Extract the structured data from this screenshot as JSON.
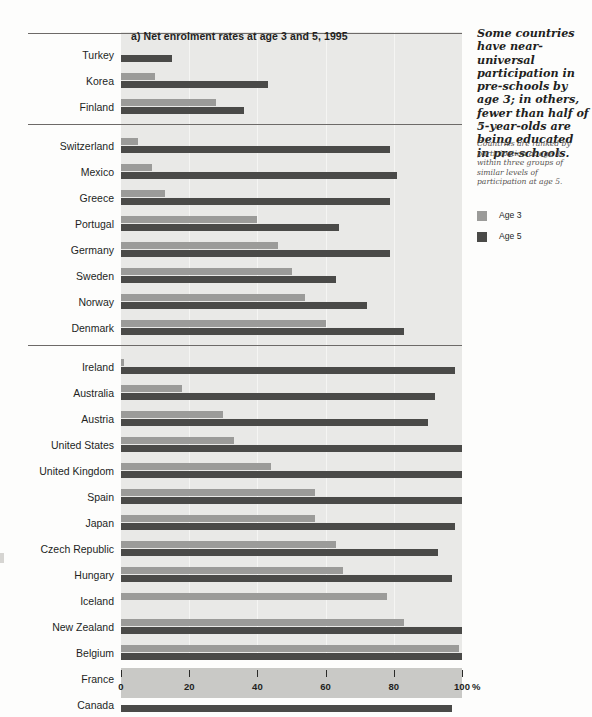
{
  "chart_data": {
    "type": "bar",
    "orientation": "horizontal",
    "title": "a) Net enrolment rates at age 3 and 5, 1995",
    "xlabel": "%",
    "ylabel": "",
    "xlim": [
      0,
      100
    ],
    "ticks": [
      0,
      20,
      40,
      60,
      80,
      100
    ],
    "grid": true,
    "legend_position": "right-sidebar",
    "series": [
      {
        "name": "Age 3",
        "color": "#9b9b99"
      },
      {
        "name": "Age 5",
        "color": "#4a4a48"
      }
    ],
    "groups": [
      {
        "id": "group-1",
        "categories": [
          "Turkey",
          "Korea",
          "Finland"
        ],
        "Age 3": [
          0,
          10,
          28
        ],
        "Age 5": [
          15,
          43,
          36
        ]
      },
      {
        "id": "group-2",
        "categories": [
          "Switzerland",
          "Mexico",
          "Greece",
          "Portugal",
          "Germany",
          "Sweden",
          "Norway",
          "Denmark"
        ],
        "Age 3": [
          5,
          9,
          13,
          40,
          46,
          50,
          54,
          60
        ],
        "Age 5": [
          79,
          81,
          79,
          64,
          79,
          63,
          72,
          83
        ]
      },
      {
        "id": "group-3",
        "categories": [
          "Ireland",
          "Australia",
          "Austria",
          "United States",
          "United Kingdom",
          "Spain",
          "Japan",
          "Czech Republic",
          "Hungary",
          "Iceland",
          "New Zealand",
          "Belgium",
          "France",
          "Canada",
          "Netherlands"
        ],
        "Age 3": [
          1,
          18,
          30,
          33,
          44,
          57,
          57,
          63,
          65,
          78,
          83,
          99,
          99,
          0,
          0
        ],
        "Age 5": [
          98,
          92,
          90,
          100,
          100,
          100,
          98,
          93,
          97,
          0,
          100,
          100,
          100,
          97,
          99
        ]
      }
    ]
  },
  "sidebar": {
    "headline": "Some countries have near-universal participation in pre-schools by age 3; in others, fewer than half of 5-year-olds are being educated in pre-schools.",
    "note": "Countries are ranked by participation at age 3, within three groups of similar levels of participation at age 5.",
    "legend": [
      {
        "label": "Age 3",
        "color": "#9b9b99"
      },
      {
        "label": "Age 5",
        "color": "#4a4a48"
      }
    ]
  }
}
